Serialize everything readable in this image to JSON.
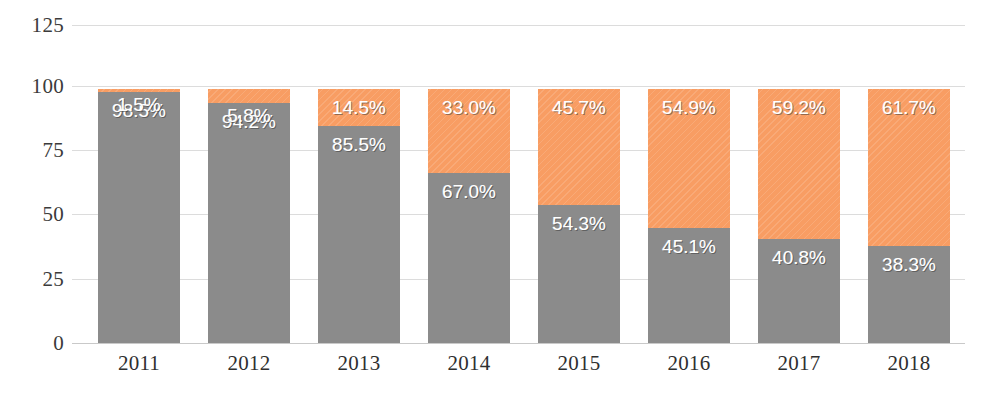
{
  "chart_data": {
    "type": "bar",
    "subtype": "stacked-bar-100-percent",
    "title": "",
    "subtitle": "",
    "xlabel": "",
    "ylabel": "",
    "categories": [
      "2011",
      "2012",
      "2013",
      "2014",
      "2015",
      "2016",
      "2017",
      "2018"
    ],
    "series": [
      {
        "name": "gray-series",
        "color": "#8b8b8b",
        "stack_position": "bottom",
        "values": [
          98.5,
          94.2,
          85.5,
          67.0,
          54.3,
          45.1,
          40.8,
          38.3
        ],
        "value_labels": [
          "98.5%",
          "94.2%",
          "85.5%",
          "67.0%",
          "54.3%",
          "45.1%",
          "40.8%",
          "38.3%"
        ]
      },
      {
        "name": "orange-series",
        "color": "#f89d63",
        "stack_position": "top",
        "values": [
          1.5,
          5.8,
          14.5,
          33.0,
          45.7,
          54.9,
          59.2,
          61.7
        ],
        "value_labels": [
          "1.5%",
          "5.8%",
          "14.5%",
          "33.0%",
          "45.7%",
          "54.9%",
          "59.2%",
          "61.7%"
        ]
      }
    ],
    "yticks": [
      0,
      25,
      50,
      75,
      100,
      125
    ],
    "ytick_labels": [
      "0",
      "25",
      "50",
      "75",
      "100",
      "125"
    ],
    "ylim": [
      0,
      125
    ],
    "grid": true,
    "grid_color": "#dcdcdc",
    "legend": false,
    "legend_position": "none",
    "bar_total": 100,
    "background": "#ffffff"
  },
  "axis": {
    "y_labels": [
      "125",
      "100",
      "75",
      "50",
      "25",
      "0"
    ],
    "x_labels": [
      "2011",
      "2012",
      "2013",
      "2014",
      "2015",
      "2016",
      "2017",
      "2018"
    ]
  },
  "colors": {
    "orange": "#f89d63",
    "gray": "#8b8b8b",
    "gridline": "#dcdcdc",
    "baseline": "#c9c9c9",
    "tick_text": "#3b3b3b",
    "label_text": "#ffffff",
    "background": "#ffffff"
  }
}
